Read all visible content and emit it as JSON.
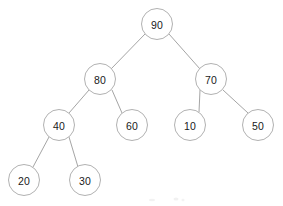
{
  "diagram": {
    "type": "binary-tree",
    "background_color": "#ffffff",
    "node_fill": "#ffffff",
    "node_stroke": "#a8a8a8",
    "edge_color": "#9a9a9a",
    "label_color": "#1a1a1a",
    "node_radius": 15.5,
    "nodes": [
      {
        "id": "n90",
        "label": "90",
        "cx": 157,
        "cy": 24,
        "level": 0,
        "role": "root"
      },
      {
        "id": "n80",
        "label": "80",
        "cx": 100,
        "cy": 79,
        "level": 1,
        "role": "left-child"
      },
      {
        "id": "n70",
        "label": "70",
        "cx": 211,
        "cy": 79,
        "level": 1,
        "role": "right-child"
      },
      {
        "id": "n40",
        "label": "40",
        "cx": 59,
        "cy": 125,
        "level": 2,
        "role": "left-child"
      },
      {
        "id": "n60",
        "label": "60",
        "cx": 132,
        "cy": 125,
        "level": 2,
        "role": "right-child"
      },
      {
        "id": "n10",
        "label": "10",
        "cx": 190,
        "cy": 125,
        "level": 2,
        "role": "left-child"
      },
      {
        "id": "n50",
        "label": "50",
        "cx": 258,
        "cy": 125,
        "level": 2,
        "role": "right-child"
      },
      {
        "id": "n20",
        "label": "20",
        "cx": 24,
        "cy": 180,
        "level": 3,
        "role": "left-child"
      },
      {
        "id": "n30",
        "label": "30",
        "cx": 85,
        "cy": 180,
        "level": 3,
        "role": "right-child"
      }
    ],
    "edges": [
      {
        "id": "e90-80",
        "from": "n90",
        "to": "n80",
        "x1": 145,
        "y1": 34,
        "x2": 111,
        "y2": 69
      },
      {
        "id": "e90-70",
        "from": "n90",
        "to": "n70",
        "x1": 169,
        "y1": 34,
        "x2": 200,
        "y2": 69
      },
      {
        "id": "e80-40",
        "from": "n80",
        "to": "n40",
        "x1": 89,
        "y1": 90,
        "x2": 69,
        "y2": 113
      },
      {
        "id": "e80-60",
        "from": "n80",
        "to": "n60",
        "x1": 112,
        "y1": 90,
        "x2": 122,
        "y2": 113
      },
      {
        "id": "e70-10",
        "from": "n70",
        "to": "n10",
        "x1": 200,
        "y1": 90,
        "x2": 199,
        "y2": 112
      },
      {
        "id": "e70-50",
        "from": "n70",
        "to": "n50",
        "x1": 223,
        "y1": 90,
        "x2": 248,
        "y2": 113
      },
      {
        "id": "e40-20",
        "from": "n40",
        "to": "n20",
        "x1": 49,
        "y1": 137,
        "x2": 33,
        "y2": 167
      },
      {
        "id": "e40-30",
        "from": "n40",
        "to": "n30",
        "x1": 69,
        "y1": 137,
        "x2": 78,
        "y2": 167
      }
    ]
  }
}
